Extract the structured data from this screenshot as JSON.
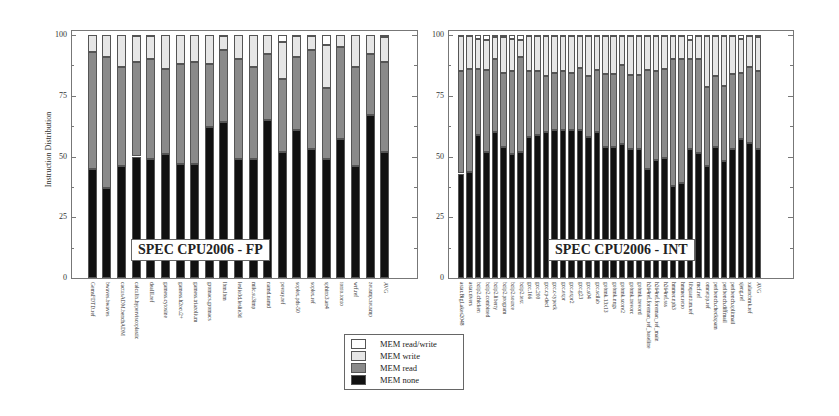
{
  "colors": {
    "mem_none": "#111111",
    "mem_read": "#8a8a8a",
    "mem_write": "#e6e6e6",
    "mem_readwrite": "#ffffff"
  },
  "legend": {
    "items": [
      {
        "label": "MEM read/write",
        "key": "mem_readwrite"
      },
      {
        "label": "MEM write",
        "key": "mem_write"
      },
      {
        "label": "MEM read",
        "key": "mem_read"
      },
      {
        "label": "MEM none",
        "key": "mem_none"
      }
    ]
  },
  "chart_data": [
    {
      "type": "bar",
      "stacked": true,
      "title": "SPEC CPU2006 - FP",
      "xlabel": "",
      "ylabel": "Instruction Distribution",
      "ylim": [
        0,
        100
      ],
      "yticks": [
        0,
        25,
        50,
        75,
        100
      ],
      "grid": false,
      "legend_position": "bottom-center",
      "categories": [
        "GemsFDTD.ref",
        "bwaves.bwaves",
        "cactusADM.benchADM",
        "calculix.hyperviscoplastic",
        "dealII.ref",
        "gamess.cytosine",
        "gamess.h2ocu2+",
        "gamess.triazolium",
        "gromacs.gromacs",
        "lbm.lbm",
        "leslie3d.leslie3d",
        "milc.su3imp",
        "namd.namd",
        "povray.ref",
        "soplex.pds-50",
        "soplex.ref",
        "sphinx3.an4",
        "tonto.tonto",
        "wrf.ref",
        "zeusmp.zeusmp",
        "AVG"
      ],
      "series": [
        {
          "name": "MEM none",
          "values": [
            45,
            37,
            46,
            50,
            49,
            51,
            47,
            47,
            62,
            64,
            49,
            49,
            65,
            52,
            61,
            53,
            49,
            57,
            46,
            67,
            52
          ]
        },
        {
          "name": "MEM read",
          "values": [
            48,
            54,
            41,
            39,
            41,
            35,
            41,
            42,
            26,
            30,
            41,
            38,
            27,
            30,
            30,
            41,
            29,
            38,
            41,
            25,
            37
          ]
        },
        {
          "name": "MEM write",
          "values": [
            7,
            9,
            13,
            10.5,
            9.5,
            14,
            12,
            11,
            12,
            5.5,
            10,
            13,
            8,
            15,
            8.5,
            5.5,
            18,
            5,
            13,
            8,
            10
          ]
        },
        {
          "name": "MEM read/write",
          "values": [
            0,
            0,
            0,
            0.5,
            0.5,
            0,
            0,
            0,
            0,
            0.5,
            0,
            0,
            0,
            3,
            0.5,
            0.5,
            4,
            0,
            0,
            0,
            1
          ]
        }
      ]
    },
    {
      "type": "bar",
      "stacked": true,
      "title": "SPEC CPU2006 - INT",
      "xlabel": "",
      "ylabel": "",
      "ylim": [
        0,
        100
      ],
      "yticks": [
        0,
        25,
        50,
        75,
        100
      ],
      "grid": false,
      "categories": [
        "astar.BigLakes2048",
        "astar.rivers",
        "bzip2.chicken",
        "bzip2.combined",
        "bzip2.liberty",
        "bzip2.program",
        "bzip2.source",
        "bzip2.text",
        "gcc.166",
        "gcc.200",
        "gcc.cp-decl",
        "gcc.c-typeck",
        "gcc.expr",
        "gcc.expr2",
        "gcc.g23",
        "gcc.s04",
        "gcc.scilab",
        "gobmk.13x13",
        "gobmk.nngs",
        "gobmk.score2",
        "gobmk.trevorc",
        "gobmk.trevord",
        "h264ref.foreman_ref_baseline",
        "h264ref.foreman_ref_main",
        "h264ref.sss",
        "hmmer.nph3",
        "hmmer.retro",
        "libquantum.ref",
        "mcf.ref",
        "omnetpp.ref",
        "perlbench.checkspam",
        "perlbench.diffmail",
        "perlbench.splitmail",
        "sjeng.ref",
        "xalancbmk.ref",
        "AVG"
      ],
      "series": [
        {
          "name": "MEM none",
          "values": [
            43,
            43.5,
            59,
            52,
            60,
            54,
            51,
            52,
            58,
            59,
            60,
            61,
            61,
            61,
            61,
            58,
            60,
            54,
            54,
            55,
            53,
            53,
            45,
            48.5,
            49.5,
            38,
            39,
            53,
            51.5,
            46,
            54,
            48,
            53,
            57,
            55.5,
            53
          ]
        },
        {
          "name": "MEM read",
          "values": [
            42,
            42.5,
            27,
            33.5,
            30,
            30.5,
            34,
            39,
            27,
            26,
            23,
            23.5,
            24,
            23.5,
            25.5,
            25,
            25.5,
            30,
            30,
            32.5,
            30.5,
            30.5,
            40.5,
            36.5,
            36.5,
            52,
            51,
            37,
            38.5,
            32.5,
            29,
            31,
            31,
            27.5,
            31.5,
            32
          ]
        },
        {
          "name": "MEM write",
          "values": [
            14.5,
            13.5,
            12.5,
            12.5,
            9,
            14.5,
            13.5,
            7,
            14.5,
            14.5,
            16.5,
            15,
            14.5,
            15,
            13,
            16.5,
            14,
            15.5,
            15.5,
            12,
            16,
            16,
            14,
            14.5,
            13.5,
            9.5,
            9.5,
            8,
            9.5,
            21,
            16.5,
            20.5,
            15.5,
            14,
            12.5,
            14
          ]
        },
        {
          "name": "MEM read/write",
          "values": [
            0.5,
            0.5,
            1.5,
            2,
            1,
            1,
            1.5,
            2,
            0.5,
            0.5,
            0.5,
            0.5,
            0.5,
            0.5,
            0.5,
            0.5,
            0.5,
            0.5,
            0.5,
            0.5,
            0.5,
            0.5,
            0.5,
            0.5,
            0.5,
            0.5,
            0.5,
            2,
            0.5,
            0.5,
            0.5,
            0.5,
            0.5,
            1.5,
            0.5,
            1
          ]
        }
      ]
    }
  ]
}
